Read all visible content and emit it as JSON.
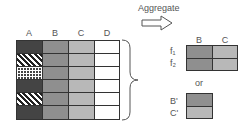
{
  "left_table": {
    "columns": [
      "A",
      "B",
      "C",
      "D"
    ],
    "rows": 6,
    "column_a_patterns": [
      "dark",
      "diag",
      "check",
      "dark",
      "diag",
      "dark"
    ]
  },
  "arrow": {
    "label": "Aggregate"
  },
  "result_table": {
    "columns": [
      "B",
      "C"
    ],
    "row_labels": [
      "f₁",
      "f₂"
    ]
  },
  "or_label": "or",
  "alt_table": {
    "row_labels": [
      "B'",
      "C'"
    ]
  },
  "colors": {
    "dark": "#444444",
    "mid": "#8f8f8f",
    "light": "#b8b8b8"
  }
}
